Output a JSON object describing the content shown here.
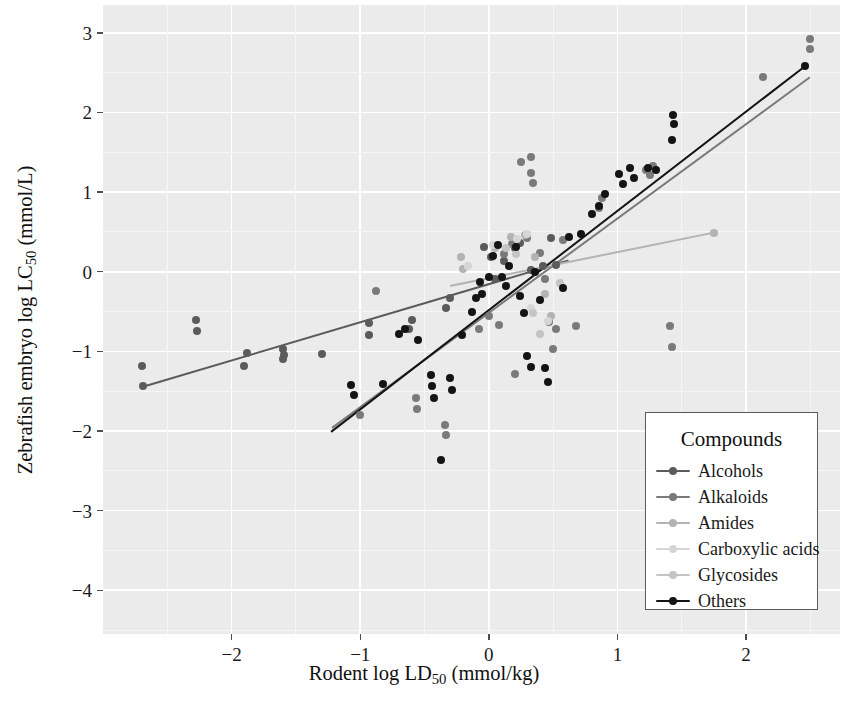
{
  "chart_data": {
    "type": "scatter",
    "title": "",
    "xlabel": "Rodent log LD50 (mmol/kg)",
    "ylabel": "Zebrafish embryo log LC50 (mmol/L)",
    "xlabel_base": "Rodent log LD",
    "xlabel_sub": "50",
    "xlabel_unit": " (mmol/kg)",
    "ylabel_base": "Zebrafish embryo log LC",
    "ylabel_sub": "50",
    "ylabel_unit": " (mmol/L)",
    "xlim": [
      -3.0,
      2.73
    ],
    "ylim": [
      -4.55,
      3.35
    ],
    "xticks": [
      -2,
      -1,
      0,
      1,
      2
    ],
    "xticklabels": [
      "−2",
      "−1",
      "0",
      "1",
      "2"
    ],
    "yticks": [
      -4,
      -3,
      -2,
      -1,
      0,
      1,
      2,
      3
    ],
    "yticklabels": [
      "−4",
      "−3",
      "−2",
      "−1",
      "0",
      "1",
      "2",
      "3"
    ],
    "grid": true,
    "minor_grid": true,
    "panel_background": "#ebebeb",
    "grid_color": "#ffffff",
    "legend_position": "bottom-right",
    "legend_title": "Compounds",
    "series": [
      {
        "name": "Alcohols",
        "color": "#5b5b5b",
        "fit": {
          "x0": -2.7,
          "y0": -1.45,
          "x1": 0.62,
          "y1": 0.14
        },
        "points": [
          [
            -2.7,
            -1.18
          ],
          [
            -2.69,
            -1.44
          ],
          [
            -2.28,
            -0.6
          ],
          [
            -2.27,
            -0.74
          ],
          [
            -1.9,
            -1.18
          ],
          [
            -1.88,
            -1.02
          ],
          [
            -1.6,
            -0.97
          ],
          [
            -1.6,
            -1.1
          ],
          [
            -1.59,
            -1.05
          ],
          [
            -1.3,
            -1.03
          ],
          [
            -0.93,
            -0.65
          ],
          [
            -0.93,
            -0.79
          ],
          [
            -0.62,
            -0.72
          ],
          [
            -0.6,
            -0.6
          ],
          [
            -0.33,
            -0.45
          ],
          [
            -0.3,
            -0.33
          ],
          [
            -0.04,
            0.31
          ],
          [
            0.02,
            0.18
          ],
          [
            0.05,
            -0.09
          ],
          [
            0.12,
            0.14
          ],
          [
            0.2,
            0.3
          ],
          [
            0.24,
            0.36
          ],
          [
            0.33,
            0.02
          ],
          [
            0.42,
            0.07
          ],
          [
            0.48,
            0.42
          ],
          [
            0.52,
            0.09
          ]
        ]
      },
      {
        "name": "Alkaloids",
        "color": "#7a7a7a",
        "fit": {
          "x0": -1.22,
          "y0": -1.97,
          "x1": 2.5,
          "y1": 2.44
        },
        "points": [
          [
            -1.0,
            -1.8
          ],
          [
            -0.88,
            -0.24
          ],
          [
            -0.57,
            -1.58
          ],
          [
            -0.56,
            -1.72
          ],
          [
            -0.34,
            -1.92
          ],
          [
            -0.33,
            -2.05
          ],
          [
            -0.08,
            -0.72
          ],
          [
            0.0,
            -0.55
          ],
          [
            0.08,
            -0.67
          ],
          [
            0.12,
            0.22
          ],
          [
            0.18,
            0.35
          ],
          [
            0.2,
            -1.28
          ],
          [
            0.25,
            1.38
          ],
          [
            0.3,
            0.42
          ],
          [
            0.33,
            1.44
          ],
          [
            0.33,
            1.24
          ],
          [
            0.34,
            1.12
          ],
          [
            0.4,
            0.23
          ],
          [
            0.44,
            -0.09
          ],
          [
            0.47,
            -0.63
          ],
          [
            0.5,
            -0.97
          ],
          [
            0.52,
            -0.72
          ],
          [
            0.58,
            0.4
          ],
          [
            0.68,
            -0.68
          ],
          [
            0.86,
            0.8
          ],
          [
            0.88,
            0.93
          ],
          [
            1.22,
            1.28
          ],
          [
            1.25,
            1.21
          ],
          [
            1.28,
            1.33
          ],
          [
            1.41,
            -0.68
          ],
          [
            1.42,
            -0.95
          ],
          [
            2.13,
            2.44
          ],
          [
            2.5,
            2.92
          ],
          [
            2.5,
            2.8
          ]
        ]
      },
      {
        "name": "Amides",
        "color": "#b3b3b3",
        "fit": {
          "x0": -0.3,
          "y0": -0.18,
          "x1": 1.75,
          "y1": 0.49
        },
        "points": [
          [
            -0.22,
            0.19
          ],
          [
            -0.2,
            0.04
          ],
          [
            0.05,
            0.3
          ],
          [
            0.17,
            0.44
          ],
          [
            0.28,
            0.46
          ],
          [
            0.36,
            0.18
          ],
          [
            0.44,
            -0.28
          ],
          [
            0.48,
            -0.55
          ],
          [
            1.75,
            0.49
          ]
        ]
      },
      {
        "name": "Carboxylic acids",
        "color": "#d6d6d6",
        "fit": null,
        "points": [
          [
            -0.16,
            0.07
          ],
          [
            0.03,
            0.33
          ],
          [
            0.22,
            0.41
          ],
          [
            0.3,
            0.48
          ],
          [
            0.33,
            -0.45
          ],
          [
            0.46,
            -0.62
          ]
        ]
      },
      {
        "name": "Glycosides",
        "color": "#c4c4c4",
        "fit": null,
        "points": [
          [
            0.13,
            0.3
          ],
          [
            0.21,
            0.22
          ],
          [
            0.34,
            -0.52
          ],
          [
            0.4,
            -0.78
          ],
          [
            0.55,
            -0.14
          ]
        ]
      },
      {
        "name": "Others",
        "color": "#141414",
        "fit": {
          "x0": -1.23,
          "y0": -2.02,
          "x1": 2.46,
          "y1": 2.58
        },
        "points": [
          [
            -1.07,
            -1.42
          ],
          [
            -1.05,
            -1.55
          ],
          [
            -0.82,
            -1.41
          ],
          [
            -0.7,
            -0.78
          ],
          [
            -0.65,
            -0.72
          ],
          [
            -0.55,
            -0.86
          ],
          [
            -0.45,
            -1.3
          ],
          [
            -0.44,
            -1.44
          ],
          [
            -0.43,
            -1.58
          ],
          [
            -0.37,
            -2.36
          ],
          [
            -0.3,
            -1.34
          ],
          [
            -0.29,
            -1.48
          ],
          [
            -0.21,
            -0.8
          ],
          [
            -0.13,
            -0.5
          ],
          [
            -0.1,
            -0.33
          ],
          [
            -0.07,
            -0.13
          ],
          [
            -0.05,
            -0.28
          ],
          [
            0.0,
            -0.07
          ],
          [
            0.03,
            0.2
          ],
          [
            0.07,
            0.33
          ],
          [
            0.1,
            -0.06
          ],
          [
            0.13,
            -0.18
          ],
          [
            0.16,
            0.07
          ],
          [
            0.21,
            0.31
          ],
          [
            0.24,
            -0.3
          ],
          [
            0.27,
            -0.52
          ],
          [
            0.3,
            -1.06
          ],
          [
            0.33,
            -1.2
          ],
          [
            0.36,
            0.0
          ],
          [
            0.4,
            -0.36
          ],
          [
            0.44,
            -1.21
          ],
          [
            0.46,
            -1.38
          ],
          [
            0.58,
            -0.2
          ],
          [
            0.62,
            0.44
          ],
          [
            0.72,
            0.48
          ],
          [
            0.8,
            0.72
          ],
          [
            0.86,
            0.83
          ],
          [
            0.9,
            0.98
          ],
          [
            1.01,
            1.23
          ],
          [
            1.04,
            1.1
          ],
          [
            1.1,
            1.3
          ],
          [
            1.13,
            1.18
          ],
          [
            1.24,
            1.3
          ],
          [
            1.3,
            1.28
          ],
          [
            1.42,
            1.65
          ],
          [
            1.43,
            1.97
          ],
          [
            1.44,
            1.85
          ],
          [
            2.46,
            2.58
          ]
        ]
      }
    ]
  },
  "legend": {
    "title": "Compounds",
    "items": [
      {
        "label": "Alcohols",
        "color": "#5b5b5b"
      },
      {
        "label": "Alkaloids",
        "color": "#7a7a7a"
      },
      {
        "label": "Amides",
        "color": "#b3b3b3"
      },
      {
        "label": "Carboxylic acids",
        "color": "#d6d6d6"
      },
      {
        "label": "Glycosides",
        "color": "#c4c4c4"
      },
      {
        "label": "Others",
        "color": "#141414"
      }
    ]
  }
}
